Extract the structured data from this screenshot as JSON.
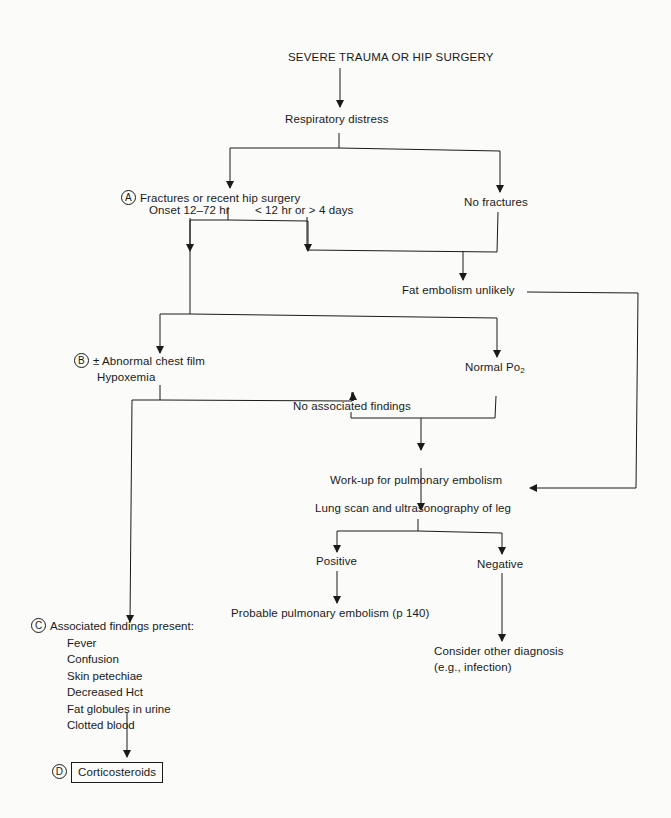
{
  "flowchart": {
    "start": "SEVERE TRAUMA OR HIP SURGERY",
    "respiratory_distress": "Respiratory distress",
    "fractures": {
      "badge": "A",
      "label": "Fractures or recent hip surgery"
    },
    "no_fractures": "No fractures",
    "onset": "Onset 12–72 hr",
    "onset_other": "< 12 hr or > 4 days",
    "fat_embolism_unlikely": "Fat embolism unlikely",
    "abnormal_chest": {
      "badge": "B",
      "line1": "± Abnormal chest film",
      "line2": "Hypoxemia"
    },
    "normal_po2": {
      "label": "Normal Po",
      "subscript": "2"
    },
    "no_associated_findings": "No associated findings",
    "workup": "Work-up for pulmonary embolism",
    "lung_scan": "Lung scan and ultrasonography of leg",
    "positive": "Positive",
    "negative": "Negative",
    "probable_pe": "Probable pulmonary embolism (p 140)",
    "consider_other": {
      "line1": "Consider other diagnosis",
      "line2": "(e.g., infection)"
    },
    "associated_findings": {
      "badge": "C",
      "heading": "Associated findings present:",
      "items": [
        "Fever",
        "Confusion",
        "Skin petechiae",
        "Decreased Hct",
        "Fat globules in urine",
        "Clotted blood"
      ]
    },
    "treatment": {
      "badge": "D",
      "label": "Corticosteroids"
    }
  },
  "colors": {
    "ink": "#1a1a1a",
    "background": "#fbfbf9"
  }
}
